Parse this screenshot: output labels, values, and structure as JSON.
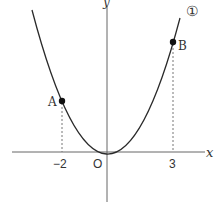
{
  "diagram": {
    "type": "function-graph",
    "curve_label": "①",
    "axes": {
      "x_label": "x",
      "y_label": "y",
      "origin_label": "O"
    },
    "ticks": [
      {
        "value": "-2",
        "label": "−2"
      },
      {
        "value": "3",
        "label": "3"
      }
    ],
    "points": [
      {
        "name": "A",
        "x": -2,
        "label": "A"
      },
      {
        "name": "B",
        "x": 3,
        "label": "B"
      }
    ],
    "colors": {
      "curve": "#2a2a2a",
      "axis": "#555555",
      "dashed": "#777777"
    }
  }
}
